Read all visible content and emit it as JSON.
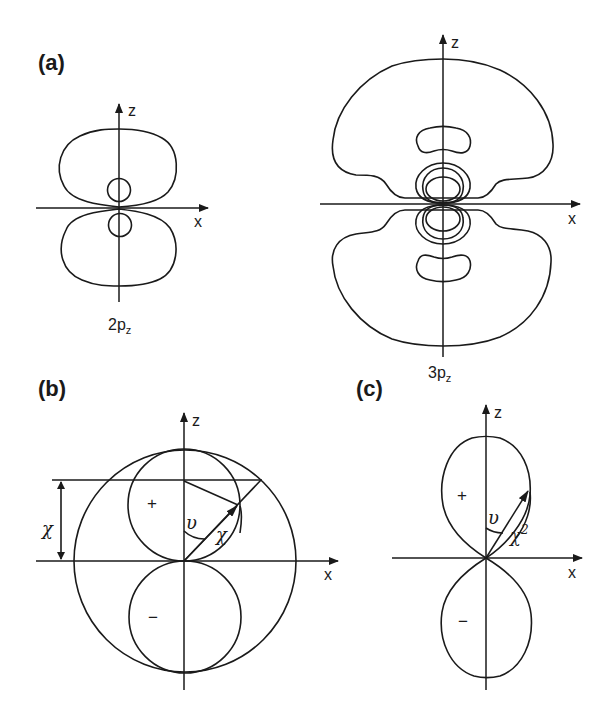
{
  "figure": {
    "panels": [
      {
        "id": "a",
        "label": "(a)",
        "description": "Contour plots of hydrogen p_z orbital probability densities",
        "orbitals": [
          {
            "name": "2p_z",
            "base": "2p",
            "subscript": "z",
            "axes": {
              "vertical": "z",
              "horizontal": "x"
            }
          },
          {
            "name": "3p_z",
            "base": "3p",
            "subscript": "z",
            "axes": {
              "vertical": "z",
              "horizontal": "x"
            }
          }
        ]
      },
      {
        "id": "b",
        "label": "(b)",
        "description": "Polar plot of angular function chi for p_z orbital",
        "axes": {
          "vertical": "z",
          "horizontal": "x"
        },
        "annotations": {
          "angle": "υ",
          "radius": "χ",
          "height": "χ",
          "upper_sign": "+",
          "lower_sign": "−"
        }
      },
      {
        "id": "c",
        "label": "(c)",
        "description": "Polar plot of chi squared for p_z orbital",
        "axes": {
          "vertical": "z",
          "horizontal": "x"
        },
        "annotations": {
          "angle": "υ",
          "radius": "χ",
          "radius_exp": "2",
          "upper_sign": "+",
          "lower_sign": "−"
        }
      }
    ]
  },
  "colors": {
    "line": "#1a1a1a",
    "background": "#ffffff"
  }
}
